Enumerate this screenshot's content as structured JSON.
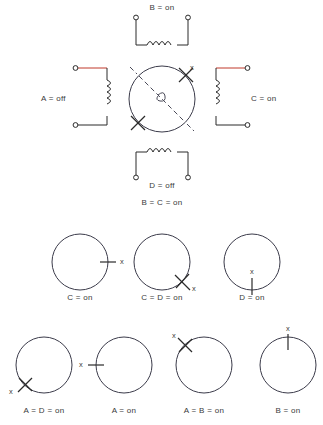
{
  "diagram": {
    "title_text": "",
    "colors": {
      "ink": "#2b2b2b",
      "energized_wire": "#c0392b",
      "ring": "#3b3b4a",
      "background": "#ffffff"
    },
    "marker_label": "x"
  },
  "top_assembly": {
    "coils": [
      {
        "id": "B",
        "position": "top",
        "label": "B = on",
        "state": "on",
        "energized": false,
        "orientation": "horizontal"
      },
      {
        "id": "A",
        "position": "left",
        "label": "A = off",
        "state": "off",
        "energized": true,
        "orientation": "vertical"
      },
      {
        "id": "C",
        "position": "right",
        "label": "C = on",
        "state": "on",
        "energized": true,
        "orientation": "vertical"
      },
      {
        "id": "D",
        "position": "bottom",
        "label": "D = off",
        "state": "off",
        "energized": false,
        "orientation": "horizontal"
      }
    ],
    "rotor": {
      "marker_label": "x",
      "rotor_angle_deg": 45,
      "description": "rotor needle along upper-right / lower-left diagonal"
    },
    "caption": "B = C = on"
  },
  "sequence_row_1": {
    "steps": [
      {
        "label": "C = on",
        "angle_deg": 0,
        "marker_label": "x",
        "marker_side": "right"
      },
      {
        "label": "C = D = on",
        "angle_deg": 315,
        "marker_label": "x",
        "marker_side": "lower-right"
      },
      {
        "label": "D = on",
        "angle_deg": 270,
        "marker_label": "x",
        "marker_side": "bottom"
      }
    ]
  },
  "sequence_row_2": {
    "steps": [
      {
        "label": "A = D = on",
        "angle_deg": 225,
        "marker_label": "x",
        "marker_side": "lower-left"
      },
      {
        "label": "A = on",
        "angle_deg": 180,
        "marker_label": "x",
        "marker_side": "left"
      },
      {
        "label": "A = B = on",
        "angle_deg": 135,
        "marker_label": "x",
        "marker_side": "upper-left"
      },
      {
        "label": "B = on",
        "angle_deg": 90,
        "marker_label": "x",
        "marker_side": "top"
      }
    ]
  }
}
